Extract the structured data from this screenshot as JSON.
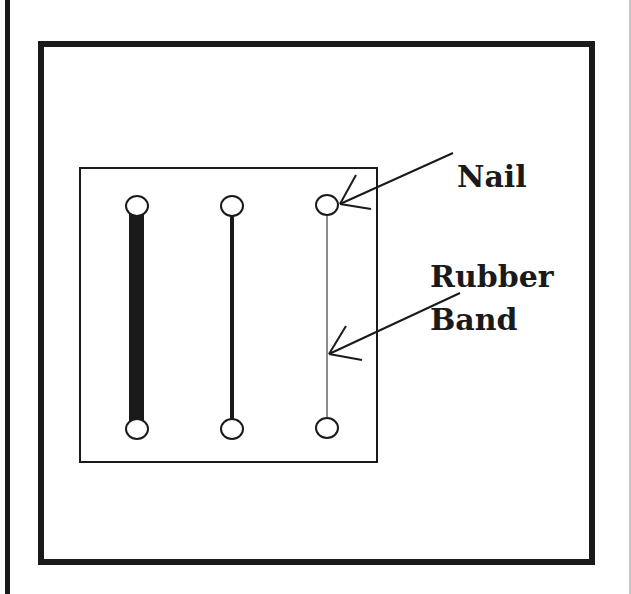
{
  "diagram": {
    "title": "",
    "labels": {
      "nail": "Nail",
      "rubber_band_line1": "Rubber",
      "rubber_band_line2": "Band"
    },
    "colors": {
      "ink": "#1a1a1a",
      "background": "#ffffff"
    },
    "components": [
      {
        "name": "outer-frame",
        "description": "Outer square frame"
      },
      {
        "name": "board",
        "description": "Board with nails"
      },
      {
        "name": "band-thick",
        "thickness": "thick"
      },
      {
        "name": "band-medium",
        "thickness": "medium"
      },
      {
        "name": "band-thin",
        "thickness": "thin"
      }
    ]
  }
}
